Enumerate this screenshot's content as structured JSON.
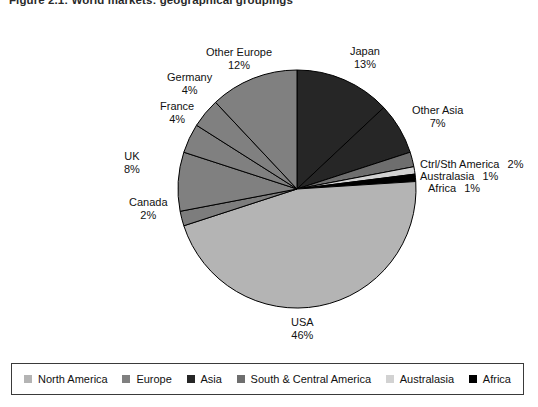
{
  "figure": {
    "title": "Figure 2.1: World markets: geographical groupings"
  },
  "chart_data": {
    "type": "pie",
    "title": "Figure 2.1: World markets: geographical groupings",
    "categories": [
      "Japan",
      "Other Asia",
      "Ctrl/Sth America",
      "Australasia",
      "Africa",
      "USA",
      "Canada",
      "UK",
      "France",
      "Germany",
      "Other Europe"
    ],
    "values": [
      13,
      7,
      2,
      1,
      1,
      46,
      2,
      8,
      4,
      4,
      12
    ],
    "value_labels": [
      "13%",
      "7%",
      "2%",
      "1%",
      "1%",
      "46%",
      "2%",
      "8%",
      "4%",
      "4%",
      "12%"
    ],
    "units": "percent",
    "start_angle_deg": 0,
    "direction": "clockwise",
    "legend_position": "bottom",
    "slices": [
      {
        "label": "Japan",
        "value": 13,
        "value_label": "13%",
        "group": "Asia",
        "color": "#262626"
      },
      {
        "label": "Other Asia",
        "value": 7,
        "value_label": "7%",
        "group": "Asia",
        "color": "#262626"
      },
      {
        "label": "Ctrl/Sth America",
        "value": 2,
        "value_label": "2%",
        "group": "South & Central America",
        "color": "#6e6e6e"
      },
      {
        "label": "Australasia",
        "value": 1,
        "value_label": "1%",
        "group": "Australasia",
        "color": "#d2d2d2"
      },
      {
        "label": "Africa",
        "value": 1,
        "value_label": "1%",
        "group": "Africa",
        "color": "#000000"
      },
      {
        "label": "USA",
        "value": 46,
        "value_label": "46%",
        "group": "North America",
        "color": "#b4b4b4"
      },
      {
        "label": "Canada",
        "value": 2,
        "value_label": "2%",
        "group": "North America",
        "color": "#7d7d7d"
      },
      {
        "label": "UK",
        "value": 8,
        "value_label": "8%",
        "group": "Europe",
        "color": "#808080"
      },
      {
        "label": "France",
        "value": 4,
        "value_label": "4%",
        "group": "Europe",
        "color": "#808080"
      },
      {
        "label": "Germany",
        "value": 4,
        "value_label": "4%",
        "group": "Europe",
        "color": "#808080"
      },
      {
        "label": "Other Europe",
        "value": 12,
        "value_label": "12%",
        "group": "Europe",
        "color": "#808080"
      }
    ],
    "legend": [
      {
        "label": "North America",
        "color": "#b4b4b4"
      },
      {
        "label": "Europe",
        "color": "#808080"
      },
      {
        "label": "Asia",
        "color": "#262626"
      },
      {
        "label": "South & Central America",
        "color": "#6e6e6e"
      },
      {
        "label": "Australasia",
        "color": "#d2d2d2"
      },
      {
        "label": "Africa",
        "color": "#000000"
      }
    ]
  }
}
